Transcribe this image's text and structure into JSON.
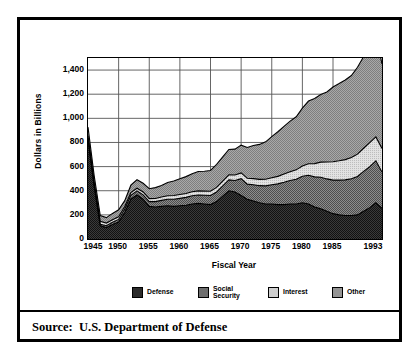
{
  "figure": {
    "source_note": "Source:  U.S. Department of Defense"
  },
  "chart_data": {
    "type": "area",
    "stacked": true,
    "title": "",
    "xlabel": "Fiscal Year",
    "ylabel": "Dollars in Billions",
    "xlim": [
      1945,
      1993
    ],
    "ylim": [
      0,
      1500
    ],
    "grid": true,
    "legend_position": "bottom",
    "x_tick_labels": [
      "1945",
      "1950",
      "1955",
      "1960",
      "1965",
      "1970",
      "1975",
      "1980",
      "1985",
      "1993"
    ],
    "x_tick_values": [
      1945,
      1950,
      1955,
      1960,
      1965,
      1970,
      1975,
      1980,
      1985,
      1993
    ],
    "y_tick_labels": [
      "0",
      "200",
      "400",
      "600",
      "800",
      "1,000",
      "1,200",
      "1,400"
    ],
    "y_tick_values": [
      0,
      200,
      400,
      600,
      800,
      1000,
      1200,
      1400
    ],
    "colors": {
      "defense": "#2b2b2b",
      "social_security": "#6e6e6e",
      "interest": "#cfcfcf",
      "other": "#949494"
    },
    "x": [
      1945,
      1946,
      1947,
      1948,
      1949,
      1950,
      1951,
      1952,
      1953,
      1954,
      1955,
      1956,
      1957,
      1958,
      1959,
      1960,
      1961,
      1962,
      1963,
      1964,
      1965,
      1966,
      1967,
      1968,
      1969,
      1970,
      1971,
      1972,
      1973,
      1974,
      1975,
      1976,
      1977,
      1978,
      1979,
      1980,
      1981,
      1982,
      1983,
      1984,
      1985,
      1986,
      1987,
      1988,
      1989,
      1990,
      1991,
      1992,
      1993
    ],
    "series": [
      {
        "name": "Defense",
        "key": "defense",
        "values": [
          830,
          440,
          110,
          95,
          120,
          140,
          220,
          330,
          365,
          330,
          270,
          265,
          270,
          275,
          270,
          275,
          280,
          290,
          295,
          290,
          285,
          310,
          355,
          400,
          390,
          360,
          330,
          315,
          300,
          290,
          290,
          285,
          285,
          290,
          290,
          300,
          290,
          265,
          250,
          230,
          210,
          200,
          195,
          195,
          200,
          230,
          260,
          300,
          255
        ]
      },
      {
        "name": "Social Security",
        "key": "social_security",
        "values": [
          5,
          8,
          12,
          15,
          18,
          22,
          28,
          32,
          34,
          36,
          40,
          45,
          50,
          55,
          60,
          62,
          65,
          68,
          70,
          72,
          75,
          80,
          85,
          90,
          95,
          140,
          125,
          135,
          142,
          150,
          160,
          172,
          185,
          195,
          205,
          220,
          238,
          250,
          262,
          268,
          278,
          288,
          295,
          305,
          318,
          330,
          340,
          348,
          300
        ]
      },
      {
        "name": "Interest",
        "key": "interest",
        "values": [
          22,
          24,
          25,
          22,
          22,
          22,
          22,
          22,
          22,
          24,
          25,
          26,
          28,
          28,
          30,
          32,
          32,
          33,
          34,
          35,
          36,
          38,
          40,
          42,
          45,
          48,
          48,
          50,
          52,
          55,
          58,
          62,
          68,
          72,
          78,
          85,
          95,
          110,
          125,
          140,
          152,
          160,
          168,
          175,
          185,
          192,
          198,
          198,
          195
        ]
      },
      {
        "name": "Other",
        "key": "other",
        "values": [
          70,
          55,
          48,
          45,
          52,
          58,
          48,
          62,
          70,
          72,
          82,
          90,
          95,
          110,
          120,
          130,
          140,
          150,
          160,
          165,
          172,
          190,
          200,
          210,
          215,
          230,
          255,
          275,
          290,
          310,
          340,
          370,
          395,
          420,
          440,
          480,
          520,
          540,
          560,
          580,
          620,
          640,
          660,
          680,
          720,
          760,
          800,
          850,
          700
        ]
      }
    ],
    "legend": [
      {
        "label": "Defense",
        "key": "defense"
      },
      {
        "label": "Social\nSecurity",
        "key": "social_security"
      },
      {
        "label": "Interest",
        "key": "interest"
      },
      {
        "label": "Other",
        "key": "other"
      }
    ]
  }
}
